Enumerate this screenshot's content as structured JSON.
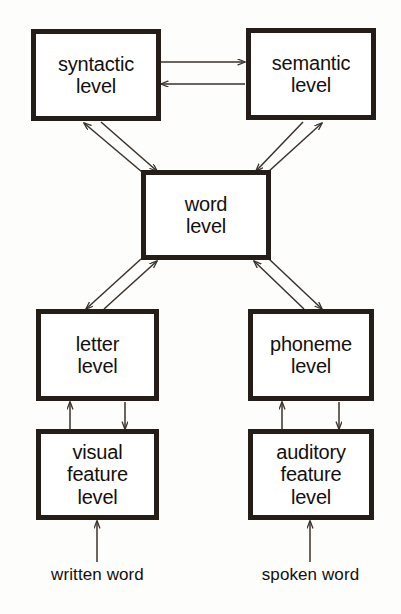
{
  "diagram": {
    "background_color": "#fdfdfb",
    "box_border_color": "#241d18",
    "arrow_color": "#3a322b",
    "nodes": [
      {
        "id": "syntactic",
        "label": "syntactic\nlevel"
      },
      {
        "id": "semantic",
        "label": "semantic\nlevel"
      },
      {
        "id": "word",
        "label": "word\nlevel"
      },
      {
        "id": "letter",
        "label": "letter\nlevel"
      },
      {
        "id": "phoneme",
        "label": "phoneme\nlevel"
      },
      {
        "id": "visual_feature",
        "label": "visual\nfeature\nlevel"
      },
      {
        "id": "auditory_feature",
        "label": "auditory\nfeature\nlevel"
      }
    ],
    "inputs": [
      {
        "id": "written_word",
        "label": "written word"
      },
      {
        "id": "spoken_word",
        "label": "spoken word"
      }
    ],
    "connections": [
      {
        "from": "syntactic",
        "to": "semantic",
        "style": "horizontal"
      },
      {
        "from": "semantic",
        "to": "syntactic",
        "style": "horizontal"
      },
      {
        "from": "syntactic",
        "to": "word",
        "style": "diagonal"
      },
      {
        "from": "word",
        "to": "syntactic",
        "style": "diagonal"
      },
      {
        "from": "semantic",
        "to": "word",
        "style": "diagonal"
      },
      {
        "from": "word",
        "to": "semantic",
        "style": "diagonal"
      },
      {
        "from": "word",
        "to": "letter",
        "style": "diagonal"
      },
      {
        "from": "letter",
        "to": "word",
        "style": "diagonal"
      },
      {
        "from": "word",
        "to": "phoneme",
        "style": "diagonal"
      },
      {
        "from": "phoneme",
        "to": "word",
        "style": "diagonal"
      },
      {
        "from": "letter",
        "to": "visual_feature",
        "style": "vertical"
      },
      {
        "from": "visual_feature",
        "to": "letter",
        "style": "vertical"
      },
      {
        "from": "phoneme",
        "to": "auditory_feature",
        "style": "vertical"
      },
      {
        "from": "auditory_feature",
        "to": "phoneme",
        "style": "vertical"
      },
      {
        "from": "written_word",
        "to": "visual_feature",
        "style": "vertical"
      },
      {
        "from": "spoken_word",
        "to": "auditory_feature",
        "style": "vertical"
      }
    ]
  }
}
